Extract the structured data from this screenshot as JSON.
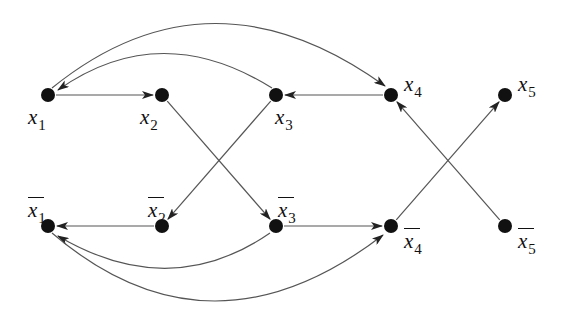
{
  "diagram": {
    "type": "directed-graph",
    "style": {
      "edge_color": "#555555",
      "node_color": "#111111",
      "node_radius": 7
    },
    "nodes": [
      {
        "id": "x1",
        "label": "x",
        "sub": "1",
        "bar": false,
        "x": 48,
        "y": 95,
        "label_x": 28,
        "label_y": 107
      },
      {
        "id": "x2",
        "label": "x",
        "sub": "2",
        "bar": false,
        "x": 162,
        "y": 95,
        "label_x": 140,
        "label_y": 107
      },
      {
        "id": "x3",
        "label": "x",
        "sub": "3",
        "bar": false,
        "x": 276,
        "y": 95,
        "label_x": 275,
        "label_y": 107
      },
      {
        "id": "x4",
        "label": "x",
        "sub": "4",
        "bar": false,
        "x": 391,
        "y": 95,
        "label_x": 404,
        "label_y": 74
      },
      {
        "id": "x5",
        "label": "x",
        "sub": "5",
        "bar": false,
        "x": 505,
        "y": 95,
        "label_x": 518,
        "label_y": 74
      },
      {
        "id": "nx1",
        "label": "x",
        "sub": "1",
        "bar": true,
        "x": 48,
        "y": 226,
        "label_x": 28,
        "label_y": 200
      },
      {
        "id": "nx2",
        "label": "x",
        "sub": "2",
        "bar": true,
        "x": 162,
        "y": 226,
        "label_x": 148,
        "label_y": 200
      },
      {
        "id": "nx3",
        "label": "x",
        "sub": "3",
        "bar": true,
        "x": 276,
        "y": 226,
        "label_x": 278,
        "label_y": 200
      },
      {
        "id": "nx4",
        "label": "x",
        "sub": "4",
        "bar": true,
        "x": 391,
        "y": 226,
        "label_x": 404,
        "label_y": 231
      },
      {
        "id": "nx5",
        "label": "x",
        "sub": "5",
        "bar": true,
        "x": 505,
        "y": 226,
        "label_x": 518,
        "label_y": 231
      }
    ],
    "edges": [
      {
        "from": "x1",
        "to": "x2",
        "kind": "straight"
      },
      {
        "from": "x4",
        "to": "x3",
        "kind": "straight"
      },
      {
        "from": "x3",
        "to": "x1",
        "kind": "arc",
        "path": "M 272 88 Q 160 18 58 90"
      },
      {
        "from": "x1",
        "to": "x4",
        "kind": "arc",
        "path": "M 52 88 Q 210 -40 385 86"
      },
      {
        "from": "x2",
        "to": "nx3",
        "kind": "straight"
      },
      {
        "from": "x3",
        "to": "nx2",
        "kind": "straight"
      },
      {
        "from": "nx5",
        "to": "x4",
        "kind": "straight"
      },
      {
        "from": "nx4",
        "to": "x5",
        "kind": "straight"
      },
      {
        "from": "nx2",
        "to": "nx1",
        "kind": "straight"
      },
      {
        "from": "nx3",
        "to": "nx4",
        "kind": "straight"
      },
      {
        "from": "nx3",
        "to": "nx1",
        "kind": "arc",
        "path": "M 270 233 Q 170 302 58 236"
      },
      {
        "from": "nx1",
        "to": "nx4",
        "kind": "arc",
        "path": "M 52 233 Q 210 368 383 235"
      }
    ]
  }
}
